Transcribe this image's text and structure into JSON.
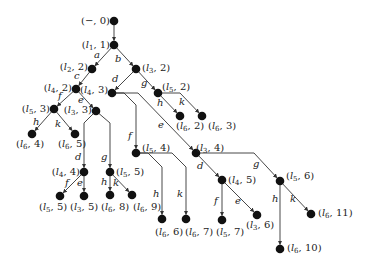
{
  "diagram": {
    "type": "tree",
    "node_color": "#111111",
    "edge_color": "#333333",
    "nodes": [
      {
        "id": "n_root",
        "label": "(−, 0)",
        "x": 114,
        "y": 21,
        "lx": 110,
        "ly": 24,
        "anchor": "end"
      },
      {
        "id": "n_l1_1",
        "label": "(l1, 1)",
        "x": 114,
        "y": 45,
        "lx": 110,
        "ly": 48,
        "anchor": "end"
      },
      {
        "id": "n_l2_2",
        "label": "(l2, 2)",
        "x": 92,
        "y": 69,
        "lx": 88,
        "ly": 70,
        "anchor": "end"
      },
      {
        "id": "n_l3_2",
        "label": "(l3, 2)",
        "x": 136,
        "y": 69,
        "lx": 142,
        "ly": 71,
        "anchor": "start"
      },
      {
        "id": "n_l4_2",
        "label": "(l4, 2)",
        "x": 76,
        "y": 89,
        "lx": 72,
        "ly": 91,
        "anchor": "end"
      },
      {
        "id": "n_l4_3",
        "label": "(l4, 3)",
        "x": 112,
        "y": 93,
        "lx": 80,
        "ly": 93,
        "anchor": "start"
      },
      {
        "id": "n_l5_2",
        "label": "(l5, 2)",
        "x": 158,
        "y": 93,
        "lx": 162,
        "ly": 90,
        "anchor": "start"
      },
      {
        "id": "n_l6_2",
        "label": "(l6, 2)",
        "x": 180,
        "y": 116,
        "lx": 176,
        "ly": 129,
        "anchor": "start"
      },
      {
        "id": "n_l6_3",
        "label": "(l6, 3)",
        "x": 202,
        "y": 116,
        "lx": 208,
        "ly": 129,
        "anchor": "start"
      },
      {
        "id": "n_l5_3",
        "label": "(l5, 3)",
        "x": 54,
        "y": 109,
        "lx": 50,
        "ly": 112,
        "anchor": "end"
      },
      {
        "id": "n_l3_3",
        "label": "(l3, 3)",
        "x": 96,
        "y": 111,
        "lx": 92,
        "ly": 113,
        "anchor": "end"
      },
      {
        "id": "n_l6_4",
        "label": "(l6, 4)",
        "x": 32,
        "y": 134,
        "lx": 16,
        "ly": 147,
        "anchor": "start"
      },
      {
        "id": "n_l6_5",
        "label": "(l6, 5)",
        "x": 75,
        "y": 134,
        "lx": 58,
        "ly": 147,
        "anchor": "start"
      },
      {
        "id": "n_l4_4",
        "label": "(l4, 4)",
        "x": 84,
        "y": 172,
        "lx": 80,
        "ly": 175,
        "anchor": "end"
      },
      {
        "id": "n_l5_5b",
        "label": "(l5, 5)",
        "x": 110,
        "y": 172,
        "lx": 116,
        "ly": 175,
        "anchor": "start"
      },
      {
        "id": "n_l5_5",
        "label": "(l5, 5)",
        "x": 60,
        "y": 196,
        "lx": 39,
        "ly": 210,
        "anchor": "start"
      },
      {
        "id": "n_l3_5",
        "label": "(l3, 5)",
        "x": 84,
        "y": 196,
        "lx": 70,
        "ly": 210,
        "anchor": "start"
      },
      {
        "id": "n_l6_8",
        "label": "(l6, 8)",
        "x": 110,
        "y": 195,
        "lx": 101,
        "ly": 210,
        "anchor": "start"
      },
      {
        "id": "n_l6_9",
        "label": "(l6, 9)",
        "x": 132,
        "y": 195,
        "lx": 133,
        "ly": 210,
        "anchor": "start"
      },
      {
        "id": "n_l5_4",
        "label": "(l5, 4)",
        "x": 136,
        "y": 153,
        "lx": 142,
        "ly": 151,
        "anchor": "start"
      },
      {
        "id": "n_l6_6",
        "label": "(l6, 6)",
        "x": 162,
        "y": 219,
        "lx": 155,
        "ly": 235,
        "anchor": "start"
      },
      {
        "id": "n_l6_7",
        "label": "(l6, 7)",
        "x": 186,
        "y": 219,
        "lx": 185,
        "ly": 235,
        "anchor": "start"
      },
      {
        "id": "n_l3_4",
        "label": "(l3, 4)",
        "x": 196,
        "y": 153,
        "lx": 196,
        "ly": 151,
        "anchor": "start"
      },
      {
        "id": "n_l4_5",
        "label": "(l4, 5)",
        "x": 222,
        "y": 180,
        "lx": 228,
        "ly": 183,
        "anchor": "start"
      },
      {
        "id": "n_l5_7",
        "label": "(l5, 7)",
        "x": 222,
        "y": 220,
        "lx": 216,
        "ly": 235,
        "anchor": "start"
      },
      {
        "id": "n_l3_6",
        "label": "(l3, 6)",
        "x": 257,
        "y": 215,
        "lx": 246,
        "ly": 228,
        "anchor": "start"
      },
      {
        "id": "n_l5_6",
        "label": "(l5, 6)",
        "x": 280,
        "y": 181,
        "lx": 286,
        "ly": 179,
        "anchor": "start"
      },
      {
        "id": "n_l6_11",
        "label": "(l6, 11)",
        "x": 311,
        "y": 214,
        "lx": 318,
        "ly": 216,
        "anchor": "start"
      },
      {
        "id": "n_l6_10",
        "label": "(l6, 10)",
        "x": 280,
        "y": 249,
        "lx": 287,
        "ly": 251,
        "anchor": "start"
      }
    ],
    "edges": [
      {
        "from": "n_root",
        "to": "n_l1_1",
        "label": "",
        "path": "M114,21 L114,45",
        "lx": 0,
        "ly": 0
      },
      {
        "from": "n_l1_1",
        "to": "n_l2_2",
        "label": "a",
        "path": "M114,45 L92,69",
        "lx": 94,
        "ly": 58
      },
      {
        "from": "n_l1_1",
        "to": "n_l3_2",
        "label": "b",
        "path": "M114,45 L136,69",
        "lx": 115,
        "ly": 62
      },
      {
        "from": "n_l2_2",
        "to": "n_l4_2",
        "label": "c",
        "path": "M92,69 L76,89",
        "lx": 74,
        "ly": 79
      },
      {
        "from": "n_l3_2",
        "to": "n_l4_3",
        "label": "d",
        "path": "M136,69 L112,93",
        "lx": 112,
        "ly": 82
      },
      {
        "from": "n_l3_2",
        "to": "n_l5_2",
        "label": "g",
        "path": "M136,69 L158,93",
        "lx": 141,
        "ly": 86
      },
      {
        "from": "n_l5_2",
        "to": "n_l6_2",
        "label": "h",
        "path": "M158,93 L180,116",
        "lx": 157,
        "ly": 106
      },
      {
        "from": "n_l5_2",
        "to": "n_l6_3",
        "label": "k",
        "path": "M158,93 L180,93 L202,116",
        "lx": 179,
        "ly": 105
      },
      {
        "from": "n_l4_2",
        "to": "n_l5_3",
        "label": "f",
        "path": "M76,89 L54,109",
        "lx": 58,
        "ly": 99
      },
      {
        "from": "n_l4_2",
        "to": "n_l3_3",
        "label": "e",
        "path": "M76,89 L96,111",
        "lx": 78,
        "ly": 103
      },
      {
        "from": "n_l5_3",
        "to": "n_l6_4",
        "label": "h",
        "path": "M54,109 L32,134",
        "lx": 33,
        "ly": 125
      },
      {
        "from": "n_l5_3",
        "to": "n_l6_5",
        "label": "k",
        "path": "M54,109 L75,134",
        "lx": 55,
        "ly": 127
      },
      {
        "from": "n_l3_3",
        "to": "n_l4_4",
        "label": "d",
        "path": "M96,111 L84,123 L84,172",
        "lx": 75,
        "ly": 160
      },
      {
        "from": "n_l3_3",
        "to": "n_l5_5b",
        "label": "g",
        "path": "M96,111 L110,123 L110,172",
        "lx": 101,
        "ly": 160
      },
      {
        "from": "n_l4_4",
        "to": "n_l5_5",
        "label": "f",
        "path": "M84,172 L60,196",
        "lx": 65,
        "ly": 186
      },
      {
        "from": "n_l4_4",
        "to": "n_l3_5",
        "label": "e",
        "path": "M84,172 L84,196",
        "lx": 77,
        "ly": 186
      },
      {
        "from": "n_l5_5b",
        "to": "n_l6_8",
        "label": "h",
        "path": "M110,172 L110,195",
        "lx": 101,
        "ly": 185
      },
      {
        "from": "n_l5_5b",
        "to": "n_l6_9",
        "label": "k",
        "path": "M110,172 L132,195",
        "lx": 113,
        "ly": 186
      },
      {
        "from": "n_l4_3",
        "to": "n_l5_4",
        "label": "f",
        "path": "M112,93 L124,93 L136,105 L136,153",
        "lx": 128,
        "ly": 139
      },
      {
        "from": "n_l4_3",
        "to": "n_l3_4",
        "label": "e",
        "path": "M112,93 L138,93 L196,153",
        "lx": 158,
        "ly": 128
      },
      {
        "from": "n_l5_4",
        "to": "n_l6_6",
        "label": "h",
        "path": "M136,153 L148,153 L162,167 L162,219",
        "lx": 153,
        "ly": 197
      },
      {
        "from": "n_l5_4",
        "to": "n_l6_7",
        "label": "k",
        "path": "M136,153 L172,153 L186,167 L186,219",
        "lx": 177,
        "ly": 197
      },
      {
        "from": "n_l3_4",
        "to": "n_l4_5",
        "label": "d",
        "path": "M196,153 L222,180",
        "lx": 197,
        "ly": 169
      },
      {
        "from": "n_l3_4",
        "to": "n_l5_6",
        "label": "g",
        "path": "M196,153 L254,153 L280,181",
        "lx": 253,
        "ly": 167
      },
      {
        "from": "n_l4_5",
        "to": "n_l5_7",
        "label": "f",
        "path": "M222,180 L222,220",
        "lx": 214,
        "ly": 204
      },
      {
        "from": "n_l4_5",
        "to": "n_l3_6",
        "label": "e",
        "path": "M222,180 L257,215",
        "lx": 235,
        "ly": 204
      },
      {
        "from": "n_l5_6",
        "to": "n_l6_10",
        "label": "h",
        "path": "M280,181 L280,249",
        "lx": 272,
        "ly": 202
      },
      {
        "from": "n_l5_6",
        "to": "n_l6_11",
        "label": "k",
        "path": "M280,181 L311,214",
        "lx": 290,
        "ly": 202
      }
    ]
  }
}
